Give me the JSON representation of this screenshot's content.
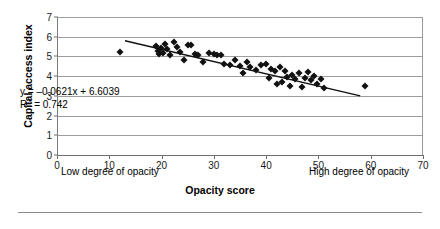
{
  "chart_data": {
    "type": "scatter",
    "title": "",
    "xlabel": "Opacity score",
    "ylabel": "Capital access index",
    "xlim": [
      0,
      70
    ],
    "ylim": [
      0,
      7
    ],
    "xticks": [
      0,
      10,
      20,
      30,
      40,
      50,
      60,
      70
    ],
    "yticks": [
      0,
      1,
      2,
      3,
      4,
      5,
      6,
      7
    ],
    "grid": "horizontal",
    "legend": "none",
    "axis_annotations": {
      "x_low": "Low degree of opacity",
      "x_high": "High degree of opacity"
    },
    "annotations": {
      "equation": "y = –0.0621x + 6.6039",
      "r_squared_label": "R",
      "r_squared_exp": "2",
      "r_squared_value": " = 0.742"
    },
    "trendline": {
      "type": "linear",
      "slope": -0.0621,
      "intercept": 6.6039,
      "r_squared": 0.742,
      "x_start": 13.0,
      "x_end": 58.0,
      "color": "#111111"
    },
    "series": [
      {
        "name": "Countries",
        "marker": "diamond",
        "color": "#111111",
        "points": [
          [
            12.0,
            5.25
          ],
          [
            19.0,
            5.55
          ],
          [
            19.4,
            5.3
          ],
          [
            19.6,
            5.12
          ],
          [
            19.8,
            5.45
          ],
          [
            20.2,
            5.18
          ],
          [
            20.6,
            5.62
          ],
          [
            21.0,
            5.38
          ],
          [
            21.6,
            5.05
          ],
          [
            22.4,
            5.72
          ],
          [
            23.0,
            5.48
          ],
          [
            23.6,
            5.22
          ],
          [
            24.2,
            4.8
          ],
          [
            25.0,
            5.58
          ],
          [
            25.6,
            5.6
          ],
          [
            26.4,
            5.12
          ],
          [
            27.0,
            5.05
          ],
          [
            28.0,
            4.72
          ],
          [
            29.0,
            5.18
          ],
          [
            30.0,
            5.12
          ],
          [
            30.6,
            5.05
          ],
          [
            31.4,
            5.08
          ],
          [
            32.0,
            4.62
          ],
          [
            33.0,
            4.55
          ],
          [
            34.0,
            4.82
          ],
          [
            35.0,
            4.52
          ],
          [
            35.6,
            4.18
          ],
          [
            36.4,
            4.72
          ],
          [
            37.0,
            4.48
          ],
          [
            38.0,
            4.3
          ],
          [
            39.0,
            4.58
          ],
          [
            40.0,
            4.62
          ],
          [
            40.6,
            3.92
          ],
          [
            41.0,
            4.35
          ],
          [
            41.6,
            4.28
          ],
          [
            42.0,
            3.58
          ],
          [
            42.6,
            4.48
          ],
          [
            43.0,
            3.72
          ],
          [
            43.6,
            4.25
          ],
          [
            44.0,
            3.95
          ],
          [
            44.6,
            3.52
          ],
          [
            45.0,
            4.05
          ],
          [
            45.6,
            3.88
          ],
          [
            46.2,
            4.18
          ],
          [
            46.8,
            3.45
          ],
          [
            47.4,
            3.92
          ],
          [
            48.0,
            4.22
          ],
          [
            48.6,
            3.78
          ],
          [
            49.2,
            4.02
          ],
          [
            49.8,
            3.62
          ],
          [
            50.4,
            3.88
          ],
          [
            51.0,
            3.42
          ],
          [
            59.0,
            3.5
          ]
        ]
      }
    ]
  }
}
